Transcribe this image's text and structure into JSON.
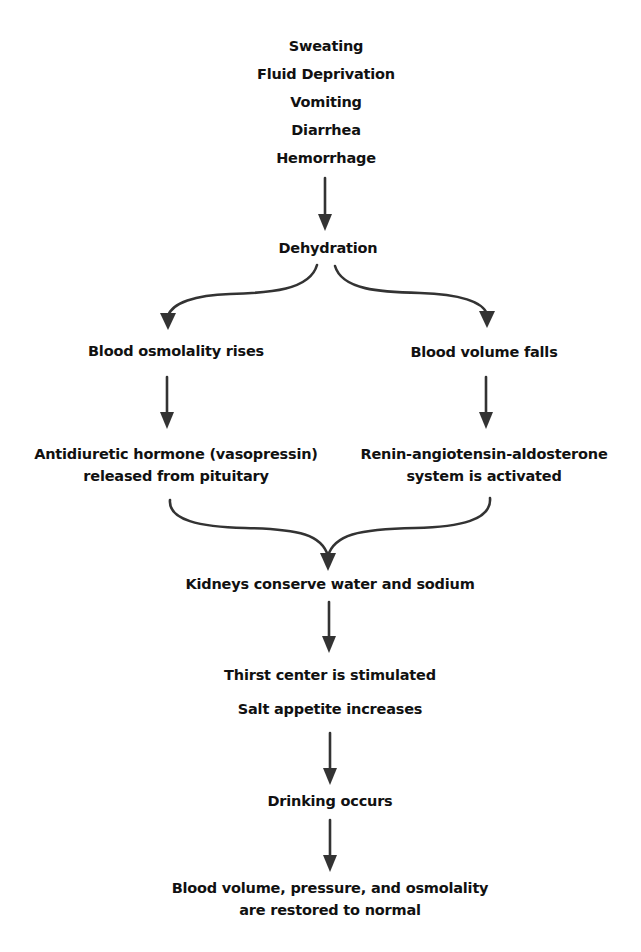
{
  "colors": {
    "background": "#ffffff",
    "text": "#111111",
    "arrow": "#333333"
  },
  "causes": [
    "Sweating",
    "Fluid Deprivation",
    "Vomiting",
    "Diarrhea",
    "Hemorrhage"
  ],
  "dehydration": "Dehydration",
  "left_branch": {
    "step1": "Blood osmolality rises",
    "step2_line1": "Antidiuretic hormone (vasopressin)",
    "step2_line2": "released from pituitary"
  },
  "right_branch": {
    "step1": "Blood volume falls",
    "step2_line1": "Renin-angiotensin-aldosterone",
    "step2_line2": "system is activated"
  },
  "kidneys": "Kidneys conserve water and sodium",
  "thirst": "Thirst center is stimulated",
  "salt": "Salt appetite increases",
  "drinking": "Drinking occurs",
  "outcome": {
    "line1": "Blood volume, pressure, and osmolality",
    "line2": "are restored to normal"
  }
}
